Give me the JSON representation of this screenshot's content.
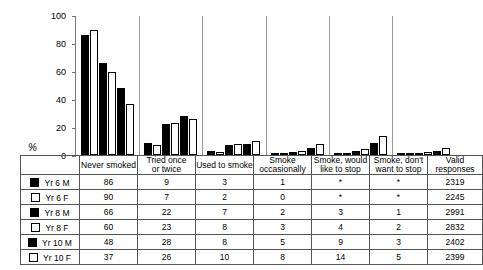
{
  "chart_data": {
    "type": "bar",
    "title": "",
    "xlabel": "",
    "ylabel": "%",
    "ylim": [
      0,
      100
    ],
    "yticks": [
      0,
      20,
      40,
      60,
      80,
      100
    ],
    "grid": false,
    "legend_position": "table-row-labels",
    "categories": [
      "Never smoked",
      "Tried once or twice",
      "Used to smoke",
      "Smoke occasionally",
      "Smoke, would like to stop",
      "Smoke, don't want to stop"
    ],
    "series": [
      {
        "name": "Yr 6 M",
        "fill": "black",
        "values": [
          86,
          9,
          3,
          1,
          0,
          0
        ],
        "labels": [
          "86",
          "9",
          "3",
          "1",
          "*",
          "*"
        ],
        "valid_responses": 2319
      },
      {
        "name": "Yr 6 F",
        "fill": "white",
        "values": [
          90,
          7,
          2,
          0,
          0,
          0
        ],
        "labels": [
          "90",
          "7",
          "2",
          "0",
          "*",
          "*"
        ],
        "valid_responses": 2245
      },
      {
        "name": "Yr 8 M",
        "fill": "black",
        "values": [
          66,
          22,
          7,
          2,
          3,
          1
        ],
        "labels": [
          "66",
          "22",
          "7",
          "2",
          "3",
          "1"
        ],
        "valid_responses": 2991
      },
      {
        "name": "Yr 8 F",
        "fill": "white",
        "values": [
          60,
          23,
          8,
          3,
          4,
          2
        ],
        "labels": [
          "60",
          "23",
          "8",
          "3",
          "4",
          "2"
        ],
        "valid_responses": 2832
      },
      {
        "name": "Yr 10 M",
        "fill": "black",
        "values": [
          48,
          28,
          8,
          5,
          9,
          3
        ],
        "labels": [
          "48",
          "28",
          "8",
          "5",
          "9",
          "3"
        ],
        "valid_responses": 2402
      },
      {
        "name": "Yr 10 F",
        "fill": "white",
        "values": [
          37,
          26,
          10,
          8,
          14,
          5
        ],
        "labels": [
          "37",
          "26",
          "10",
          "8",
          "14",
          "5"
        ],
        "valid_responses": 2399
      }
    ]
  },
  "axis": {
    "y_label": "%",
    "ticks": [
      "100",
      "80",
      "60",
      "40",
      "20",
      "0"
    ]
  },
  "table": {
    "headers": [
      "Never smoked",
      "Tried once or twice",
      "Used to smoke",
      "Smoke occasionally",
      "Smoke, would like to stop",
      "Smoke, don't want to stop",
      "Valid responses"
    ],
    "header_lines": [
      [
        "Never smoked",
        ""
      ],
      [
        "Tried once",
        "or twice"
      ],
      [
        "Used to smoke",
        ""
      ],
      [
        "Smoke",
        "occasionally"
      ],
      [
        "Smoke, would",
        "like to stop"
      ],
      [
        "Smoke, don't",
        "want to stop"
      ],
      [
        "Valid",
        "responses"
      ]
    ],
    "rows": [
      {
        "legend": "Yr 6 M",
        "fill": "m",
        "cells": [
          "86",
          "9",
          "3",
          "1",
          "*",
          "*",
          "2319"
        ]
      },
      {
        "legend": "Yr 6 F",
        "fill": "f",
        "cells": [
          "90",
          "7",
          "2",
          "0",
          "*",
          "*",
          "2245"
        ]
      },
      {
        "legend": "Yr 8 M",
        "fill": "m",
        "cells": [
          "66",
          "22",
          "7",
          "2",
          "3",
          "1",
          "2991"
        ]
      },
      {
        "legend": "Yr 8 F",
        "fill": "f",
        "cells": [
          "60",
          "23",
          "8",
          "3",
          "4",
          "2",
          "2832"
        ]
      },
      {
        "legend": "Yr 10 M",
        "fill": "m",
        "cells": [
          "48",
          "28",
          "8",
          "5",
          "9",
          "3",
          "2402"
        ]
      },
      {
        "legend": "Yr 10 F",
        "fill": "f",
        "cells": [
          "37",
          "26",
          "10",
          "8",
          "14",
          "5",
          "2399"
        ]
      }
    ]
  }
}
